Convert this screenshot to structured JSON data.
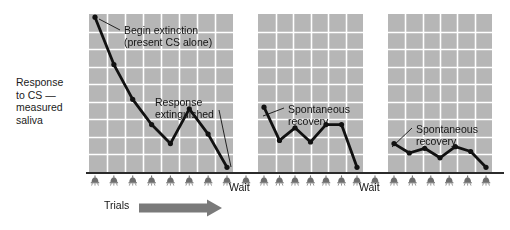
{
  "figure": {
    "ylabel": "Response\nto CS —\nmeasured\nsaliva",
    "trials_label": "Trials",
    "wait_label_1": "Wait",
    "wait_label_2": "Wait",
    "arrow_color": "#7a7a7a",
    "line_color": "#111111",
    "panel_fill": "#b6b6b6",
    "grid_color": "#ffffff",
    "axis_color": "#2b2b2b",
    "tick_icon": "bell-icon"
  },
  "annotations": [
    {
      "id": "begin-extinction",
      "text": "Begin extinction\n(present CS alone)",
      "x": 124,
      "y": 24
    },
    {
      "id": "response-extinguished",
      "text": "Response\nextinguished",
      "x": 155,
      "y": 96
    },
    {
      "id": "spontaneous-recovery-1",
      "text": "Spontaneous\nrecovery",
      "x": 288,
      "y": 103
    },
    {
      "id": "spontaneous-recovery-2",
      "text": "Spontaneous\nrecovery",
      "x": 416,
      "y": 123
    }
  ],
  "chart_data": {
    "type": "line",
    "title": "",
    "xlabel": "Trials",
    "ylabel": "Response to CS — measured saliva",
    "grid": true,
    "legend": "none",
    "axis_ticks_labeled": false,
    "ylim": [
      0,
      100
    ],
    "panels": [
      {
        "name": "acquisition-extinction",
        "caption": "Extinction trials",
        "x_px": [
          89,
          233
        ],
        "y_px": [
          14,
          172
        ],
        "grid_cols": 8,
        "grid_rows": 9,
        "x": [
          1,
          2,
          3,
          4,
          5,
          6,
          7,
          8
        ],
        "values": [
          98,
          68,
          46,
          30,
          18,
          40,
          24,
          3
        ]
      },
      {
        "name": "spontaneous-recovery-first",
        "caption": "After rest: spontaneous recovery",
        "x_px": [
          258,
          363
        ],
        "y_px": [
          14,
          172
        ],
        "grid_cols": 6,
        "grid_rows": 9,
        "x": [
          1,
          2,
          3,
          4,
          5,
          6,
          7
        ],
        "values": [
          41,
          20,
          28,
          19,
          30,
          30,
          3
        ]
      },
      {
        "name": "spontaneous-recovery-second",
        "caption": "After further rest: weaker spontaneous recovery",
        "x_px": [
          388,
          492
        ],
        "y_px": [
          14,
          172
        ],
        "grid_cols": 6,
        "grid_rows": 9,
        "x": [
          1,
          2,
          3,
          4,
          5,
          6,
          7
        ],
        "values": [
          18,
          12,
          15,
          9,
          16,
          13,
          3
        ]
      }
    ]
  },
  "ticks": {
    "panel1_count": 8,
    "panel2_count": 7,
    "panel3_count": 6,
    "y": 176
  }
}
